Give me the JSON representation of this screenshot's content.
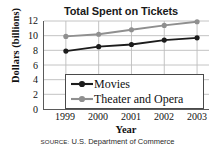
{
  "chart_data": {
    "type": "line",
    "title": "Total Spent on Tickets",
    "xlabel": "Year",
    "ylabel": "Dollars (billions)",
    "categories": [
      "1999",
      "2000",
      "2001",
      "2002",
      "2003"
    ],
    "x": [
      1999,
      2000,
      2001,
      2002,
      2003
    ],
    "ylim": [
      0,
      12
    ],
    "yticks": [
      0,
      2,
      4,
      6,
      8,
      10,
      12
    ],
    "ytick_labels": [
      "0",
      "2",
      "4",
      "6",
      "8",
      "10",
      "12"
    ],
    "grid": true,
    "grid_axes": "both",
    "legend_position": "lower-center-inside",
    "series": [
      {
        "name": "Movies",
        "color": "#1c1c1c",
        "marker": "circle",
        "values": [
          7.9,
          8.5,
          8.8,
          9.4,
          9.7
        ]
      },
      {
        "name": "Theater and Opera",
        "color": "#8f8f8f",
        "marker": "circle",
        "values": [
          9.9,
          10.2,
          10.8,
          11.4,
          11.9
        ]
      }
    ]
  },
  "source": {
    "label": "Source:",
    "text": "U.S. Department of Commerce"
  },
  "colors": {
    "movies": "#1c1c1c",
    "theater": "#8f8f8f",
    "axis": "#5a5a5a",
    "grid": "#bdbdbd",
    "background": "#ffffff"
  }
}
